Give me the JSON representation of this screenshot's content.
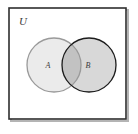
{
  "figure": {
    "type": "venn-diagram",
    "background_color": "#ffffff",
    "caption": ""
  },
  "universe": {
    "label": "U",
    "border_color": "#2e2e2e",
    "fill_color": "#ffffff",
    "shadow_color": "#b4b4b4",
    "rect": {
      "x": 9,
      "y": 8,
      "width": 117,
      "height": 111
    }
  },
  "sets": [
    {
      "name": "set-a",
      "label": "A",
      "fill_color": "#ebebeb",
      "stroke_color": "#9a9a9a",
      "cx": 54,
      "cy": 65,
      "r": 27,
      "label_x": 48,
      "label_y": 68
    },
    {
      "name": "set-b",
      "label": "B",
      "fill_color": "#d8d8d8",
      "stroke_color": "#1c1c1c",
      "cx": 89,
      "cy": 65,
      "r": 27,
      "label_x": 88,
      "label_y": 68
    }
  ],
  "intersection": {
    "name": "a-intersect-b",
    "fill_color": "#c2c2c2"
  }
}
